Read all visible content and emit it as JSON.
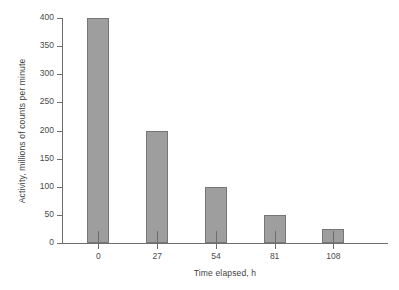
{
  "chart_data": {
    "type": "bar",
    "title": "",
    "subtitle": "",
    "xlabel": "Time elapsed, h",
    "ylabel": "Activity, millions of counts per minute",
    "categories": [
      "0",
      "27",
      "54",
      "81",
      "108"
    ],
    "values": [
      400,
      200,
      100,
      50,
      25
    ],
    "series": [
      {
        "name": "Activity",
        "values": [
          400,
          200,
          100,
          50,
          25
        ]
      }
    ],
    "ylim": [
      0,
      400
    ],
    "yticks": [
      0,
      50,
      100,
      150,
      200,
      250,
      300,
      350,
      400
    ],
    "ytick_labels": [
      "0",
      "50",
      "100",
      "150",
      "200",
      "250",
      "300",
      "350",
      "400"
    ],
    "xtick_labels": [
      "0",
      "27",
      "54",
      "81",
      "108"
    ],
    "grid": false,
    "legend": false,
    "legend_position": "none",
    "bar_color": "#9e9e9e",
    "bar_edge_color": "#767676",
    "axis_color": "#6e6e6e",
    "background_color": "#ffffff",
    "annotations": []
  }
}
